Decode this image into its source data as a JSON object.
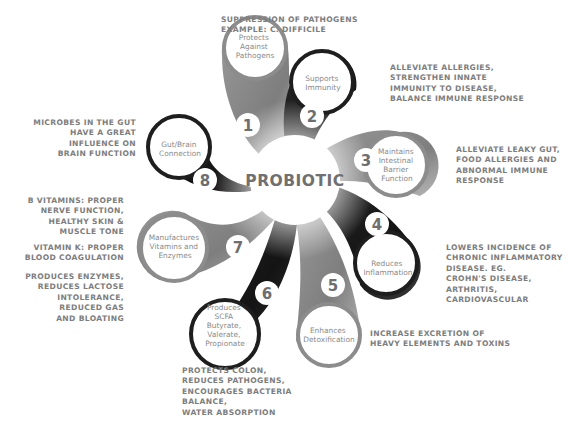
{
  "title": "PROBIOTIC",
  "colors": {
    "dark_petal": "#1e1e1e",
    "gray_petal": "#8c8c8c",
    "light_gray_petal": "#a6a6a6",
    "text": "#7d7d7d",
    "background": "#ffffff"
  },
  "petals": [
    {
      "number": "1",
      "label": [
        "Protects",
        "Against",
        "Pathogens"
      ],
      "shade": "gray",
      "note": "SUPPRESSION OF PATHOGENS\nEXAMPLE: C. DIFFICILE"
    },
    {
      "number": "2",
      "label": [
        "Supports",
        "Immunity"
      ],
      "shade": "dark",
      "note": "ALLEVIATE ALLERGIES,\nSTRENGTHEN INNATE\nIMMUNITY TO DISEASE,\nBALANCE IMMUNE RESPONSE"
    },
    {
      "number": "3",
      "label": [
        "Maintains",
        "Intestinal",
        "Barrier",
        "Function"
      ],
      "shade": "gray",
      "note": "ALLEVIATE LEAKY GUT,\nFOOD ALLERGIES AND\nABNORMAL IMMUNE\nRESPONSE"
    },
    {
      "number": "4",
      "label": [
        "Reduces",
        "Inflammation"
      ],
      "shade": "dark",
      "note": "LOWERS INCIDENCE OF\nCHRONIC INFLAMMATORY\nDISEASE. EG.\nCROHN'S DISEASE,\nARTHRITIS,\nCARDIOVASCULAR"
    },
    {
      "number": "5",
      "label": [
        "Enhances",
        "Detoxification"
      ],
      "shade": "gray",
      "note": "INCREASE EXCRETION OF\nHEAVY ELEMENTS AND TOXINS"
    },
    {
      "number": "6",
      "label": [
        "Produces",
        "SCFA",
        "Butyrate,",
        "Valerate,",
        "Propionate"
      ],
      "shade": "dark",
      "note": "PROTECTS COLON,\nREDUCES PATHOGENS,\nENCOURAGES BACTERIA\nBALANCE,\nWATER ABSORPTION"
    },
    {
      "number": "7",
      "label": [
        "Manufactures",
        "Vitamins and",
        "Enzymes"
      ],
      "shade": "gray",
      "notes": [
        "B VITAMINS: PROPER\nNERVE FUNCTION,\nHEALTHY SKIN &\nMUSCLE TONE",
        "VITAMIN K: PROPER\nBLOOD COAGULATION",
        "PRODUCES ENZYMES,\nREDUCES LACTOSE\nINTOLERANCE,\nREDUCED GAS\nAND BLOATING"
      ]
    },
    {
      "number": "8",
      "label": [
        "Gut/Brain",
        "Connection"
      ],
      "shade": "dark",
      "note": "MICROBES IN THE GUT\nHAVE A GREAT\nINFLUENCE ON\nBRAIN FUNCTION"
    }
  ]
}
